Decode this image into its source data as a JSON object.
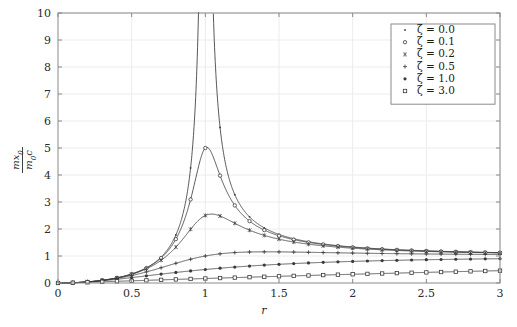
{
  "chart_data": {
    "type": "line",
    "title": "",
    "subtitle": "",
    "xlabel": "r",
    "ylabel_numerator": "m x0",
    "ylabel_denominator": "m0 c",
    "ylabel": "m x0 / (m0 c)",
    "xlim": [
      0,
      3
    ],
    "ylim": [
      0,
      10
    ],
    "xticks": [
      0,
      0.5,
      1,
      1.5,
      2,
      2.5,
      3
    ],
    "xtick_labels": [
      "0",
      "0.5",
      "1",
      "1.5",
      "2",
      "2.5",
      "3"
    ],
    "yticks": [
      0,
      1,
      2,
      3,
      4,
      5,
      6,
      7,
      8,
      9,
      10
    ],
    "ytick_labels": [
      "0",
      "1",
      "2",
      "3",
      "4",
      "5",
      "6",
      "7",
      "8",
      "9",
      "10"
    ],
    "grid": true,
    "grid_color": "#ececec",
    "axis_color": "#8a8a8a",
    "line_color": "#3a3a3a",
    "background": "#ffffff",
    "legend_position": "top-right",
    "legend_border_color": "#8a8a8a",
    "marker_interval_r": 0.1,
    "series": [
      {
        "name": "zeta = 0.0",
        "zeta": 0.0,
        "legend_label": "ζ = 0.0",
        "marker": "dot",
        "peak_r": 1.0,
        "peak_value": 10,
        "values_at": {
          "0": 0,
          "0.5": 0.333,
          "1": 10,
          "1.5": 1.8,
          "2": 1.333,
          "2.5": 1.19,
          "3": 1.125
        }
      },
      {
        "name": "zeta = 0.1",
        "zeta": 0.1,
        "legend_label": "ζ = 0.1",
        "marker": "circle",
        "peak_r": 1.01,
        "peak_value": 5.0,
        "values_at": {
          "0": 0,
          "0.5": 0.333,
          "1": 5.0,
          "1.5": 1.77,
          "2": 1.33,
          "2.5": 1.19,
          "3": 1.12
        }
      },
      {
        "name": "zeta = 0.2",
        "zeta": 0.2,
        "legend_label": "ζ = 0.2",
        "marker": "asterisk",
        "peak_r": 1.02,
        "peak_value": 2.55,
        "values_at": {
          "0": 0,
          "0.5": 0.33,
          "1": 2.5,
          "1.5": 1.63,
          "2": 1.29,
          "2.5": 1.17,
          "3": 1.11
        }
      },
      {
        "name": "zeta = 0.5",
        "zeta": 0.5,
        "legend_label": "ζ = 0.5",
        "marker": "plus",
        "peak_r": 1.1,
        "peak_value": 1.15,
        "values_at": {
          "0": 0,
          "0.5": 0.32,
          "1": 1.0,
          "1.5": 1.06,
          "2": 1.05,
          "2.5": 1.04,
          "3": 1.04
        }
      },
      {
        "name": "zeta = 1.0",
        "zeta": 1.0,
        "legend_label": "ζ = 1.0",
        "marker": "filled-dot",
        "peak_r": 3.0,
        "peak_value": 0.95,
        "values_at": {
          "0": 0,
          "0.5": 0.28,
          "1": 0.5,
          "1.5": 0.69,
          "2": 0.8,
          "2.5": 0.86,
          "3": 0.9
        }
      },
      {
        "name": "zeta = 3.0",
        "zeta": 3.0,
        "legend_label": "ζ = 3.0",
        "marker": "square",
        "peak_r": 3.0,
        "peak_value": 0.45,
        "values_at": {
          "0": 0,
          "0.5": 0.16,
          "1": 0.167,
          "1.5": 0.25,
          "2": 0.32,
          "2.5": 0.39,
          "3": 0.45
        }
      }
    ]
  },
  "axes": {
    "x_axis_label": "r",
    "y_numerator": "m x",
    "y_numerator_sub": "0",
    "y_denominator": "m",
    "y_denominator_sub": "0",
    "y_denominator_tail": "c"
  },
  "legend": {
    "entries": [
      {
        "label": "ζ = 0.0",
        "marker": "dot"
      },
      {
        "label": "ζ = 0.1",
        "marker": "circle"
      },
      {
        "label": "ζ = 0.2",
        "marker": "asterisk"
      },
      {
        "label": "ζ = 0.5",
        "marker": "plus"
      },
      {
        "label": "ζ = 1.0",
        "marker": "filled-dot"
      },
      {
        "label": "ζ = 3.0",
        "marker": "square"
      }
    ]
  }
}
